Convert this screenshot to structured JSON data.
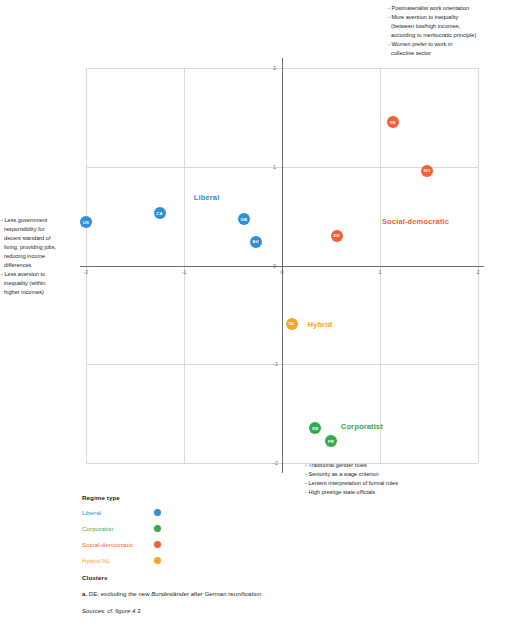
{
  "annotations": {
    "top_right": [
      "- Postmaterialist work orientation",
      "- More aversion to inequality",
      "  (between low/high incomes;",
      "  according to meritocratic principle)",
      "- Women prefer to work in",
      "  collective sector"
    ],
    "left": [
      "- Less government",
      "  responsibility for",
      "  decent standard of",
      "  living, providing jobs,",
      "  reducing income",
      "  differences",
      "- Less aversion to",
      "  inequality (within",
      "  higher incomes)"
    ],
    "bottom": [
      "- Traditional gender roles",
      "- Seniority as a wage criterion",
      "- Lenient interpretation of formal rules",
      "- High prestige state officials"
    ]
  },
  "legend": {
    "title": "Regime type",
    "items": [
      {
        "label": "Liberal",
        "color": "#2f8fd8",
        "key": "liberal"
      },
      {
        "label": "Corporatist",
        "color": "#3aa94b",
        "key": "corporatist"
      },
      {
        "label": "Social-democratic",
        "color": "#ef6136",
        "key": "socdem"
      },
      {
        "label": "Hybrid NL",
        "color": "#f5a623",
        "key": "hybrid"
      }
    ]
  },
  "notes": {
    "title": "Clusters",
    "footnote_marker": "a.",
    "footnote_text_1": " DE: excluding the new ",
    "footnote_italic": "Bundesländer",
    "footnote_text_2": " after German reunification",
    "source": "Sources: cf. figure 4.3"
  },
  "chart_data": {
    "type": "scatter",
    "title": "",
    "xlabel": "",
    "ylabel": "",
    "xlim": [
      -2,
      2
    ],
    "ylim": [
      -2,
      2
    ],
    "xticks": [
      "-2",
      "-1",
      "0",
      "1",
      "2"
    ],
    "yticks": [
      "-2",
      "-1",
      "0",
      "1",
      "2"
    ],
    "grid": true,
    "legend_position": "below-left",
    "points": [
      {
        "label": "US",
        "x": -2.0,
        "y": 0.44,
        "group": "Liberal",
        "color": "#2f8fd8",
        "key": "liberal"
      },
      {
        "label": "CA",
        "x": -1.25,
        "y": 0.53,
        "group": "Liberal",
        "color": "#2f8fd8",
        "key": "liberal"
      },
      {
        "label": "GB",
        "x": -0.39,
        "y": 0.47,
        "group": "Liberal",
        "color": "#2f8fd8",
        "key": "liberal"
      },
      {
        "label": "AU",
        "x": -0.27,
        "y": 0.24,
        "group": "Liberal",
        "color": "#2f8fd8",
        "key": "liberal"
      },
      {
        "label": "DK",
        "x": 0.56,
        "y": 0.3,
        "group": "Social-democratic",
        "color": "#ef6136",
        "key": "socdem"
      },
      {
        "label": "SE",
        "x": 1.13,
        "y": 1.45,
        "group": "Social-democratic",
        "color": "#ef6136",
        "key": "socdem"
      },
      {
        "label": "NO",
        "x": 1.48,
        "y": 0.96,
        "group": "Social-democratic",
        "color": "#ef6136",
        "key": "socdem"
      },
      {
        "label": "NL",
        "x": 0.1,
        "y": -0.59,
        "group": "Hybrid",
        "color": "#f5a623",
        "key": "hybrid"
      },
      {
        "label": "DE",
        "x": 0.34,
        "y": -1.65,
        "group": "Corporatist",
        "color": "#3aa94b",
        "key": "corporatist"
      },
      {
        "label": "FR",
        "x": 0.5,
        "y": -1.78,
        "group": "Corporatist",
        "color": "#3aa94b",
        "key": "corporatist"
      }
    ],
    "cluster_labels": [
      {
        "text": "Liberal",
        "x": -0.9,
        "y": 0.68,
        "key": "liberal"
      },
      {
        "text": "Social-democratic",
        "x": 1.02,
        "y": 0.44,
        "key": "socdem"
      },
      {
        "text": "Hybrid",
        "x": 0.26,
        "y": -0.6,
        "key": "hybrid"
      },
      {
        "text": "Corporatist",
        "x": 0.6,
        "y": -1.64,
        "key": "corporatist"
      }
    ]
  }
}
